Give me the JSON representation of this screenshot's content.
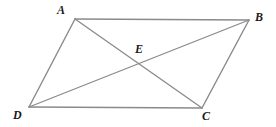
{
  "figure": {
    "kind": "geometry-diagram",
    "shape": "parallelogram",
    "background_color": "#ffffff",
    "side_stroke_color": "#8a8a8a",
    "diagonal_stroke_color": "#8a8a8a",
    "stroke_width": 1.4,
    "label_color": "#1a1a1a"
  },
  "points": {
    "A": {
      "label": "A",
      "x": 75,
      "y": 19
    },
    "B": {
      "label": "B",
      "x": 249,
      "y": 20
    },
    "C": {
      "label": "C",
      "x": 202,
      "y": 108
    },
    "D": {
      "label": "D",
      "x": 29,
      "y": 107
    },
    "E": {
      "label": "E",
      "x": 138,
      "y": 66
    }
  },
  "segments": [
    {
      "name": "side-AB",
      "from": "A",
      "to": "B",
      "kind": "side"
    },
    {
      "name": "side-BC",
      "from": "B",
      "to": "C",
      "kind": "side"
    },
    {
      "name": "side-CD",
      "from": "C",
      "to": "D",
      "kind": "side"
    },
    {
      "name": "side-DA",
      "from": "D",
      "to": "A",
      "kind": "side"
    },
    {
      "name": "diagonal-AC",
      "from": "A",
      "to": "C",
      "kind": "diagonal"
    },
    {
      "name": "diagonal-BD",
      "from": "B",
      "to": "D",
      "kind": "diagonal"
    }
  ]
}
